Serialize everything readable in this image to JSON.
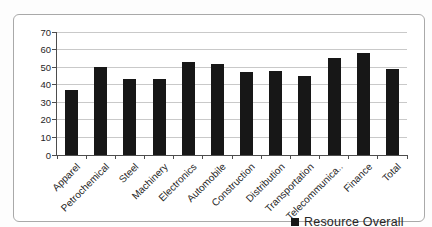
{
  "chart_data": {
    "type": "bar",
    "title": "",
    "categories": [
      "Apparel",
      "Petrochemical",
      "Steel",
      "Machinery",
      "Electronics",
      "Automobile",
      "Construction",
      "Distribution",
      "Transportation",
      "Telecommunica..",
      "Finance",
      "Total"
    ],
    "series": [
      {
        "name": "Resource Overall",
        "values": [
          37,
          50,
          43,
          43,
          53,
          52,
          47,
          48,
          45,
          55,
          58,
          49
        ]
      }
    ],
    "xlabel": "",
    "ylabel": "",
    "ylim": [
      0,
      70
    ],
    "yticks": [
      0,
      10,
      20,
      30,
      40,
      50,
      60,
      70
    ],
    "grid": true,
    "legend_position": "bottom-right",
    "bar_color": "#171717",
    "gridline_color": "#c9c9c9",
    "axis_color": "#4d4d4d",
    "text_color": "#262626",
    "frame_border_color": "#a9a9a9"
  }
}
